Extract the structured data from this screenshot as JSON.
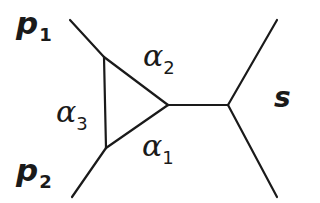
{
  "figure": {
    "kind": "feynman-diagram",
    "background_color": "#ffffff",
    "line_color": "#1a1a1a",
    "line_width": 2
  },
  "labels": {
    "p1": {
      "base": "p",
      "sub": "1"
    },
    "p2": {
      "base": "p",
      "sub": "2"
    },
    "alpha1": {
      "base": "α",
      "sub": "1"
    },
    "alpha2": {
      "base": "α",
      "sub": "2"
    },
    "alpha3": {
      "base": "α",
      "sub": "3"
    },
    "s": {
      "base": "s"
    }
  },
  "geometry": {
    "triangle": {
      "top_left": [
        104,
        57
      ],
      "bottom_left": [
        106,
        148
      ],
      "right_apex": [
        168,
        105
      ]
    },
    "external_legs": [
      {
        "name": "p1-leg",
        "from": [
          70,
          20
        ],
        "to": [
          104,
          57
        ]
      },
      {
        "name": "p2-leg",
        "from": [
          72,
          197
        ],
        "to": [
          106,
          148
        ]
      },
      {
        "name": "outgoing-upper",
        "from": [
          228,
          105
        ],
        "to": [
          277,
          20
        ]
      },
      {
        "name": "outgoing-lower",
        "from": [
          228,
          105
        ],
        "to": [
          277,
          197
        ]
      }
    ],
    "propagator": {
      "name": "s-channel",
      "from": [
        168,
        105
      ],
      "to": [
        228,
        105
      ]
    }
  }
}
